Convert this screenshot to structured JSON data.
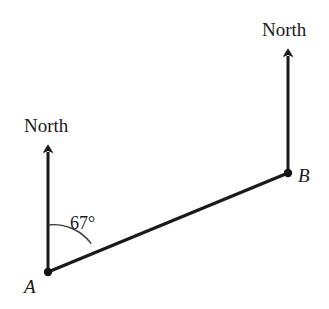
{
  "figure": {
    "type": "bearing-diagram",
    "background_color": "#ffffff",
    "line_color": "#1a1a1a",
    "arc_color": "#3a3a3a",
    "width": 329,
    "height": 309
  },
  "labels": {
    "north_left": "North",
    "north_right": "North",
    "point_a": "A",
    "point_b": "B",
    "angle": "67°"
  },
  "geometry": {
    "point_a": {
      "x": 48,
      "y": 272
    },
    "point_b": {
      "x": 288,
      "y": 173
    },
    "north_arrow_left": {
      "from_x": 48,
      "from_y": 272,
      "to_x": 48,
      "to_y": 144
    },
    "north_arrow_right": {
      "from_x": 288,
      "from_y": 173,
      "to_x": 288,
      "to_y": 48
    },
    "segment_ab": {
      "x1": 48,
      "y1": 272,
      "x2": 288,
      "y2": 173
    },
    "angle_arc": {
      "center_x": 48,
      "center_y": 272,
      "radius": 47,
      "start_angle_deg": 0,
      "end_angle_deg": 67
    },
    "angle_value_degrees": 67
  }
}
